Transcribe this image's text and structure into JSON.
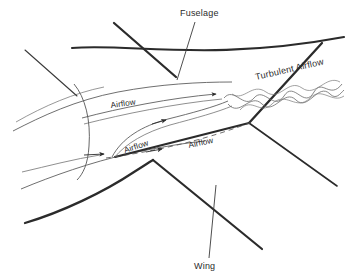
{
  "figure": {
    "background_color": "#ffffff",
    "ink_color": "#2b2b2b",
    "thin_line_color": "#4a4a4a"
  },
  "labels": {
    "fuselage": "Fuselage",
    "wing": "Wing",
    "turbulent_airflow": "Turbulent Airflow",
    "airflow_upper": "Airflow",
    "airflow_mid": "Airflow",
    "airflow_lower": "Airflow"
  },
  "annotations": [
    {
      "name": "fuselage-callout",
      "text": "Fuselage",
      "text_x": 180,
      "text_y": 16,
      "rotation": 0,
      "leader_from": [
        193,
        22
      ],
      "leader_to": [
        175,
        76
      ]
    },
    {
      "name": "wing-callout",
      "text": "Wing",
      "text_x": 196,
      "text_y": 268,
      "rotation": 0,
      "leader_from": [
        208,
        259
      ],
      "leader_to": [
        215,
        185
      ]
    },
    {
      "name": "turbulent-airflow-label",
      "text": "Turbulent Airflow",
      "text_x": 258,
      "text_y": 80,
      "rotation": -13
    },
    {
      "name": "airflow-upper-label",
      "text": "Airflow",
      "text_x": 112,
      "text_y": 108,
      "rotation": -8
    },
    {
      "name": "airflow-mid-label",
      "text": "Airflow",
      "text_x": 126,
      "text_y": 152,
      "rotation": -18
    },
    {
      "name": "airflow-lower-label",
      "text": "Airflow",
      "text_x": 190,
      "text_y": 148,
      "rotation": -12
    }
  ],
  "geometry": {
    "fuselage_top_edge": "M 72,48 C 120,44 200,60 344,38",
    "fuselage_nose_lower": "M 13,130 C 60,108 110,96 200,86",
    "fuselage_belly": "M 20,188 C 70,168 140,150 205,140",
    "fuselage_cross_section": "M 75,86 C 86,96 92,118 89,146 C 87,163 82,172 76,177",
    "wing_leading_edge_upper": "M 113,24 L 175,76",
    "wing_upper_surface_outer": "M 26,51 L 76,95",
    "wing_root_trailing": "M 118,156 L 250,122",
    "wing_root_junction": [
      152,
      160
    ],
    "wing_lower_leading": "M 25,222 C 70,208 120,186 152,160",
    "wing_lower_trailing": "M 152,160 L 262,248",
    "wing_right_upper": "M 248,122 L 320,44",
    "wing_right_lower": "M 248,122 L 336,184",
    "streamline_upper": "M 103,152 C 140,118 190,100 220,96",
    "streamline_mid": "M 110,156 C 145,130 195,114 228,110",
    "dashed_streamline": "M 108,157 C 150,150 200,140 255,120",
    "arrow_points": [
      [
        104,
        154
      ],
      [
        163,
        123
      ],
      [
        160,
        148
      ],
      [
        225,
        96
      ]
    ]
  },
  "turbulence": {
    "description": "Wavy sinusoidal streamlines of increasing amplitude downstream of wing-fuselage junction",
    "wave_count": 3,
    "start_x": 226,
    "end_x": 344
  }
}
